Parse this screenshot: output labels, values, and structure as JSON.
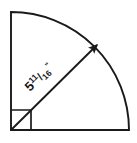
{
  "figure": {
    "shape_type": "quarter-circle-sector",
    "radius_label": {
      "whole": "5",
      "numerator": "11",
      "slash": "/",
      "denominator": "16",
      "unit_symbol": "\"",
      "full_text": "5 11/16\"",
      "meaning": "five and eleven-sixteenths inches"
    },
    "right_angle_marker": {
      "present": true,
      "angle_degrees": "90"
    },
    "sector": {
      "central_angle_degrees": "90",
      "arc_present": true
    },
    "colors": {
      "stroke": "#1a1a1a",
      "background": "#ffffff",
      "label": "#1a1a1a"
    },
    "geometry": {
      "vertex_x": 11,
      "vertex_y": 130,
      "radius_px": 118,
      "arrow_tip_x": 95,
      "arrow_tip_y": 47
    }
  }
}
